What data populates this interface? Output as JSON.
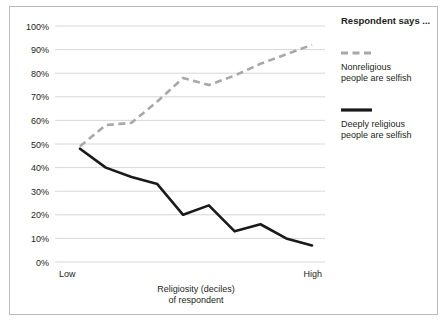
{
  "chart_data": {
    "type": "line",
    "title": "",
    "xlabel": "Religiosity (deciles) of respondent",
    "xlabel_line1": "Religiosity (deciles)",
    "xlabel_line2": "of respondent",
    "ylabel": "",
    "ylim": [
      0,
      100
    ],
    "ytick_labels": [
      "100%",
      "90%",
      "80%",
      "70%",
      "60%",
      "50%",
      "40%",
      "30%",
      "20%",
      "10%",
      "0%"
    ],
    "ytick_values": [
      100,
      90,
      80,
      70,
      60,
      50,
      40,
      30,
      20,
      10,
      0
    ],
    "grid": true,
    "legend_position": "right",
    "x_axis_start_label": "Low",
    "x_axis_end_label": "High",
    "categories": [
      1,
      2,
      3,
      4,
      5,
      6,
      7,
      8,
      9,
      10
    ],
    "series": [
      {
        "name": "Nonreligious people are selfish",
        "style": "dashed",
        "color": "#a8a8a8",
        "values": [
          49,
          58,
          59,
          68,
          78,
          75,
          79,
          84,
          88,
          92
        ]
      },
      {
        "name": "Deeply religious people are selfish",
        "style": "solid",
        "color": "#1a1a1a",
        "values": [
          48,
          40,
          36,
          33,
          20,
          24,
          13,
          16,
          10,
          7
        ]
      }
    ]
  },
  "legend": {
    "title": "Respondent says ...",
    "entries": [
      {
        "label_line1": "Nonreligious",
        "label_line2": "people are selfish",
        "style": "dashed"
      },
      {
        "label_line1": "Deeply religious",
        "label_line2": "people are selfish",
        "style": "solid"
      }
    ]
  },
  "axis": {
    "y_labels": [
      "100%",
      "90%",
      "80%",
      "70%",
      "60%",
      "50%",
      "40%",
      "30%",
      "20%",
      "10%",
      "0%"
    ],
    "x_low": "Low",
    "x_high": "High",
    "x_title_line1": "Religiosity (deciles)",
    "x_title_line2": "of respondent"
  },
  "colors": {
    "frame": "#b9b9b9",
    "grid": "#d3d3d3",
    "solid_series": "#1a1a1a",
    "dashed_series": "#a8a8a8",
    "text": "#231f20",
    "background": "#ffffff"
  }
}
